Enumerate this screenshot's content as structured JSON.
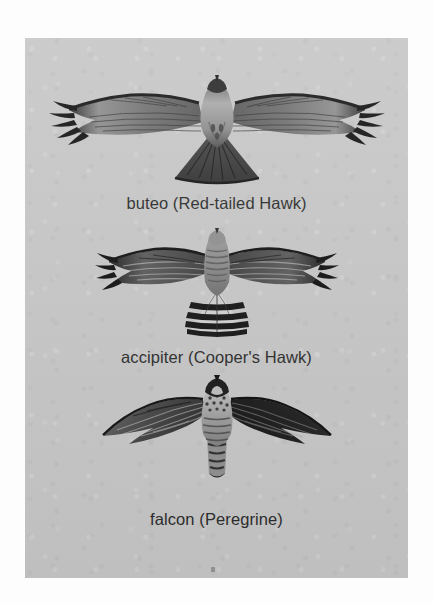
{
  "figure": {
    "background_color": "#fdfdfd",
    "plate_color": "#c6c6c6",
    "caption_color": "#2b2b2b",
    "ink_color": "#1a1a1a"
  },
  "specimens": [
    {
      "id": "buteo",
      "caption": "buteo (Red-tailed Hawk)",
      "group_name": "buteo",
      "species": "Red-tailed Hawk",
      "silhouette": "broad rounded wings with fingered primaries, short fanned tail",
      "icon": "hawk-soaring-icon"
    },
    {
      "id": "accipiter",
      "caption": "accipiter (Cooper's Hawk)",
      "group_name": "accipiter",
      "species": "Cooper's Hawk",
      "silhouette": "short rounded wings, long banded tail",
      "icon": "hawk-soaring-icon"
    },
    {
      "id": "falcon",
      "caption": "falcon (Peregrine)",
      "group_name": "falcon",
      "species": "Peregrine",
      "silhouette": "long pointed swept-back wings, narrow tapered tail",
      "icon": "falcon-soaring-icon"
    }
  ]
}
